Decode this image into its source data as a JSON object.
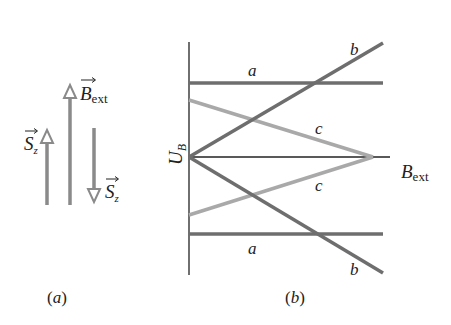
{
  "figure": {
    "panel_a": {
      "caption": "(a)",
      "caption_letter": "a",
      "arrows": [
        {
          "name": "spin-up",
          "label": "S",
          "subscript": "z",
          "direction": "up"
        },
        {
          "name": "b-ext",
          "label": "B",
          "subscript": "ext",
          "direction": "up"
        },
        {
          "name": "spin-down",
          "label": "S",
          "subscript": "z",
          "direction": "down"
        }
      ]
    },
    "panel_b": {
      "caption": "(b)",
      "caption_letter": "b",
      "ylabel": "U",
      "ylabel_sub": "B",
      "xlabel": "B",
      "xlabel_sub": "ext",
      "line_labels": {
        "a_top": "a",
        "a_bottom": "a",
        "b_top": "b",
        "b_bottom": "b",
        "c_top": "c",
        "c_bottom": "c"
      }
    }
  },
  "colors": {
    "axis": "#222222",
    "line_a": "#6e6e6e",
    "line_b": "#6e6e6e",
    "line_c": "#a9a9a9",
    "arrow": "#8a8a8a"
  }
}
